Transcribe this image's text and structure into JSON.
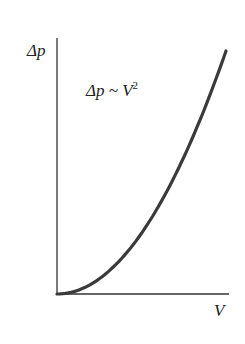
{
  "chart_data": {
    "type": "line",
    "title": "",
    "xlabel": "V",
    "ylabel": "Δp",
    "annotation": {
      "base": "Δp ~ V",
      "exponent": "2"
    },
    "grid": false,
    "legend": null,
    "ticks": {
      "x": [],
      "y": []
    },
    "series": [
      {
        "name": "Δp ~ V^2",
        "x": [
          0,
          0.2,
          0.4,
          0.6,
          0.8,
          1.0
        ],
        "y": [
          0,
          0.04,
          0.16,
          0.36,
          0.64,
          1.0
        ]
      }
    ],
    "xlim": [
      0,
      1
    ],
    "ylim": [
      0,
      1
    ],
    "colors": {
      "axis": "#333333",
      "curve": "#3a3a3a"
    }
  }
}
